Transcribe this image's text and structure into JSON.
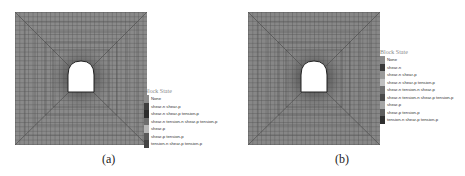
{
  "panels": [
    {
      "id": "a",
      "caption": "(a)",
      "legend": {
        "title": "Block State",
        "items": [
          {
            "label": "None",
            "color": "#8c8c8c"
          },
          {
            "label": "shear-n shear-p",
            "color": "#3f3f3f"
          },
          {
            "label": "shear-n shear-p tension-p",
            "color": "#2e2e2e"
          },
          {
            "label": "shear-n tension-n shear-p tension-p",
            "color": "#6e6e6e"
          },
          {
            "label": "shear-p",
            "color": "#b5b5b5"
          },
          {
            "label": "shear-p tension-p",
            "color": "#5a5a5a"
          },
          {
            "label": "tension-n shear-p tension-p",
            "color": "#444444"
          }
        ]
      }
    },
    {
      "id": "b",
      "caption": "(b)",
      "legend": {
        "title": "Block State",
        "items": [
          {
            "label": "None",
            "color": "#8c8c8c"
          },
          {
            "label": "shear-n",
            "color": "#3a3a3a"
          },
          {
            "label": "shear-n shear-p",
            "color": "#9a9a9a"
          },
          {
            "label": "shear-n shear-p tension-p",
            "color": "#c0c0c0"
          },
          {
            "label": "shear-n tension-n shear-p",
            "color": "#707070"
          },
          {
            "label": "shear-n tension-n shear-p tension-p",
            "color": "#4a4a4a"
          },
          {
            "label": "shear-p",
            "color": "#a5a5a5"
          },
          {
            "label": "shear-p tension-p",
            "color": "#5e5e5e"
          },
          {
            "label": "tension-n shear-p tension-p",
            "color": "#2f2f2f"
          }
        ]
      }
    }
  ]
}
